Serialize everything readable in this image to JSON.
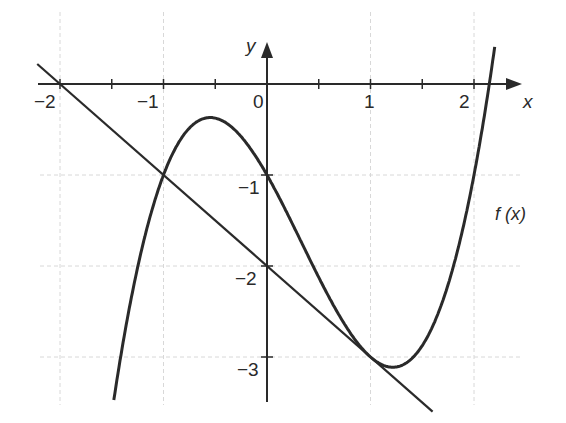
{
  "chart_data": {
    "type": "line",
    "title": "",
    "xlabel": "x",
    "ylabel": "y",
    "xlim": [
      -2.2,
      2.35
    ],
    "ylim": [
      -3.45,
      0.5
    ],
    "grid": true,
    "x_ticks": [
      -2,
      -1,
      0,
      1,
      2
    ],
    "x_tick_labels": [
      "−2",
      "−1",
      "0",
      "1",
      "2"
    ],
    "y_ticks": [
      -1,
      -2,
      -3
    ],
    "y_tick_labels": [
      "−1",
      "−2",
      "−3"
    ],
    "series": [
      {
        "name": "f(x)",
        "expression": "x^3 - x^2 - 2x - 1",
        "x": [
          -1.5,
          -1.25,
          -1.0,
          -0.75,
          -0.548,
          -0.25,
          0.0,
          0.25,
          0.5,
          0.75,
          1.0,
          1.215,
          1.5,
          1.75,
          2.0,
          2.25
        ],
        "values": [
          -3.625,
          -2.016,
          -1.0,
          -0.484,
          -0.369,
          -0.578,
          -1.0,
          -1.547,
          -2.125,
          -2.641,
          -3.0,
          -3.11,
          -2.875,
          -2.203,
          -1.0,
          0.891
        ]
      },
      {
        "name": "tangent line",
        "expression": "y = -x - 2",
        "x": [
          -2.2,
          1.6
        ],
        "values": [
          0.2,
          -3.6
        ]
      }
    ],
    "annotations": [
      {
        "text": "f (x)",
        "x": 2.3,
        "y": -1.3
      }
    ],
    "legend": "none"
  },
  "labels": {
    "x_axis": "x",
    "y_axis": "y",
    "curve": "f (x)",
    "x_ticks": [
      "−2",
      "−1",
      "0",
      "1",
      "2"
    ],
    "y_ticks": [
      "−1",
      "−2",
      "−3"
    ]
  }
}
